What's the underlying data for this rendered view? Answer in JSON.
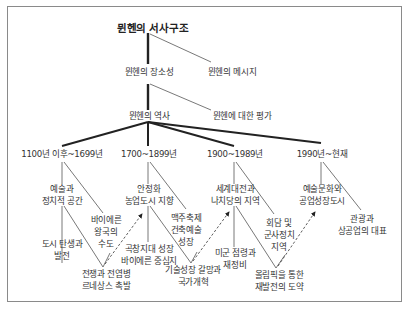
{
  "diagram": {
    "title": "뮌헨의 서사구조",
    "level1": [
      {
        "label": "뮌헨의 장소성"
      },
      {
        "label": "뮌헨의 메시지"
      }
    ],
    "level2": [
      {
        "label": "뮌헨의 역사"
      },
      {
        "label": "뮌헨에 대한 평가"
      }
    ],
    "periods": [
      {
        "label": "1100년 이후~1699년",
        "nodes": [
          {
            "label": "예술과\n정치적 공간"
          },
          {
            "label": "바이에른\n왕국의\n수도"
          },
          {
            "label": "도시 탄생과\n발전"
          },
          {
            "label": "전쟁과 전염병\n르네상스 촉발"
          }
        ]
      },
      {
        "label": "1700~1899년",
        "nodes": [
          {
            "label": "안정화\n농업도시 지향"
          },
          {
            "label": "맥주축제\n건축예술\n성장"
          },
          {
            "label": "곡창지대 성장\n바이에른 중심지"
          },
          {
            "label": "기술성장 갈망과\n국가개혁"
          }
        ]
      },
      {
        "label": "1900~1989년",
        "nodes": [
          {
            "label": "세계대전과\n나치당의 지역"
          },
          {
            "label": "회담 및\n군사정치\n지역"
          },
          {
            "label": "미군 점령과\n재정비"
          },
          {
            "label": "올림픽을 통한\n재발전의 도약"
          }
        ]
      },
      {
        "label": "1990년~현재",
        "nodes": [
          {
            "label": "예술문화와\n공업성장도시"
          },
          {
            "label": "관광과\n상공업의 대표"
          }
        ]
      }
    ],
    "colors": {
      "line": "#222222",
      "thin_line": "#555555",
      "frame": "#8a8a8a",
      "text": "#333333"
    }
  }
}
